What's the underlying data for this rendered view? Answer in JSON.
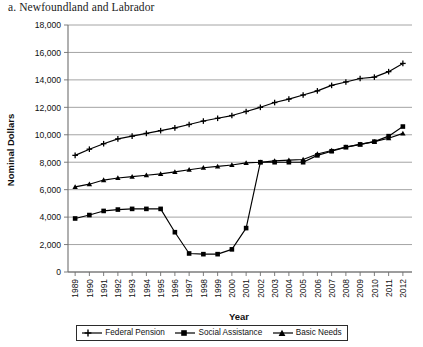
{
  "figure": {
    "caption": "a. Newfoundland and Labrador"
  },
  "legend": {
    "position": "bottom",
    "entries": [
      {
        "label": "Federal Pension",
        "marker": "plus-marker-icon",
        "color": "#000000"
      },
      {
        "label": "Social Assistance",
        "marker": "square-marker-icon",
        "color": "#000000"
      },
      {
        "label": "Basic Needs",
        "marker": "triangle-marker-icon",
        "color": "#000000"
      }
    ]
  },
  "chart_data": {
    "type": "line",
    "title": "a. Newfoundland and Labrador",
    "xlabel": "Year",
    "ylabel": "Nominal Dollars",
    "ylim": [
      0,
      18000
    ],
    "ytick_step": 2000,
    "yticks": [
      "0",
      "2,000",
      "4,000",
      "6,000",
      "8,000",
      "10,000",
      "12,000",
      "14,000",
      "16,000",
      "18,000"
    ],
    "grid": "horizontal",
    "legend_position": "bottom",
    "categories": [
      "1989",
      "1990",
      "1991",
      "1992",
      "1993",
      "1994",
      "1995",
      "1996",
      "1997",
      "1998",
      "1999",
      "2000",
      "2001",
      "2002",
      "2003",
      "2004",
      "2005",
      "2006",
      "2007",
      "2008",
      "2009",
      "2010",
      "2011",
      "2012"
    ],
    "series": [
      {
        "name": "Federal Pension",
        "marker": "plus",
        "values": [
          8500,
          8950,
          9350,
          9700,
          9900,
          10100,
          10300,
          10500,
          10750,
          11000,
          11200,
          11400,
          11700,
          12000,
          12350,
          12600,
          12900,
          13200,
          13600,
          13850,
          14100,
          14200,
          14600,
          15200
        ]
      },
      {
        "name": "Social Assistance",
        "marker": "square",
        "values": [
          3900,
          4150,
          4450,
          4550,
          4600,
          4600,
          4600,
          2900,
          1350,
          1300,
          1300,
          1650,
          3200,
          8000,
          8000,
          8000,
          8000,
          8500,
          8800,
          9100,
          9300,
          9500,
          9900,
          10600
        ]
      },
      {
        "name": "Basic Needs",
        "marker": "triangle",
        "values": [
          6200,
          6400,
          6700,
          6850,
          6950,
          7050,
          7150,
          7300,
          7450,
          7600,
          7700,
          7800,
          7950,
          8000,
          8100,
          8150,
          8200,
          8600,
          8850,
          9100,
          9300,
          9500,
          9750,
          10100
        ]
      }
    ]
  },
  "axes": {
    "x_title": "Year",
    "y_title": "Nominal Dollars"
  },
  "colors": {
    "line": "#000000",
    "grid": "#9a9a9a",
    "axis": "#6f6f6f",
    "text": "#111111"
  }
}
